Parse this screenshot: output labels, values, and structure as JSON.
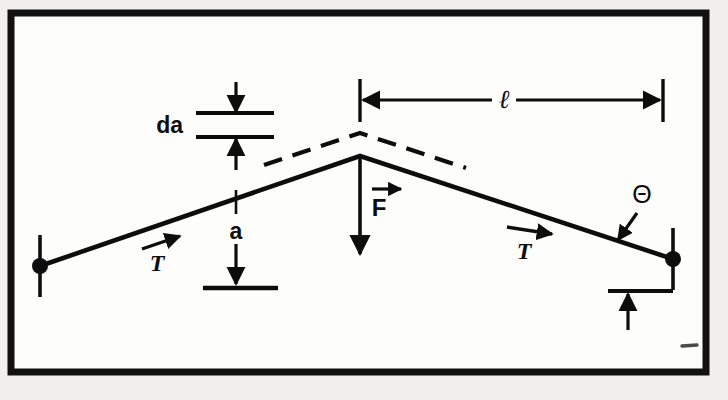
{
  "figure": {
    "background_color": "#f2f0ee",
    "paper_color": "#fdfdfc",
    "ink_color": "#0d0d0d",
    "frame": {
      "name": "figure-border",
      "x": 11,
      "y": 13,
      "width": 695,
      "height": 359,
      "stroke_width": 7
    },
    "labels": {
      "da": "da",
      "sag": "a",
      "half_span": "ℓ",
      "force": "F",
      "tension_left": "T",
      "tension_right": "T",
      "angle": "Θ"
    },
    "geometry": {
      "left_anchor": {
        "x": 40,
        "y": 266
      },
      "right_anchor": {
        "x": 673,
        "y": 259
      },
      "apex": {
        "x": 360,
        "y": 156
      },
      "dashed_apex": {
        "x": 360,
        "y": 133
      },
      "dashed_left_end": {
        "x": 264,
        "y": 165
      },
      "dashed_right_end": {
        "x": 466,
        "y": 168
      },
      "baseline_y": 288,
      "da_upper_line_y": 113,
      "da_lower_line_y": 137,
      "span_dim_y": 100,
      "span_dim_x1": 360,
      "span_dim_x2": 663
    }
  }
}
